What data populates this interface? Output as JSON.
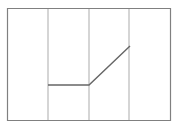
{
  "chart_data": {
    "type": "line",
    "title": "",
    "subtitle": "",
    "xlabel": "",
    "ylabel": "",
    "grid": true,
    "grid_axis": "x",
    "legend": false,
    "legend_position": "none",
    "axis_tick_labels": {
      "x": [],
      "y": []
    },
    "xlim": [
      0,
      4
    ],
    "ylim": [
      0,
      4
    ],
    "x_gridlines": [
      1,
      2,
      3
    ],
    "series": [
      {
        "name": "series-1",
        "color": "#666666",
        "x": [
          1,
          2,
          3
        ],
        "y": [
          1.3,
          1.3,
          2.65
        ]
      }
    ],
    "annotations": []
  },
  "figure": {
    "background_color": "#ffffff",
    "plot_area": {
      "left": 7,
      "top": 8,
      "right": 171,
      "bottom": 121
    },
    "frame": {
      "color": "#808080",
      "width": 1.2,
      "visible": true
    },
    "gridline_style": {
      "color": "#b3b3b3",
      "width": 1.1
    },
    "line_style": {
      "color": "#666666",
      "width": 1.4,
      "cap": "butt",
      "join": "miter"
    },
    "gridline_x_pixels": [
      48,
      89,
      129
    ],
    "polyline_points_pixels": "48,85 89,85 130,46"
  }
}
